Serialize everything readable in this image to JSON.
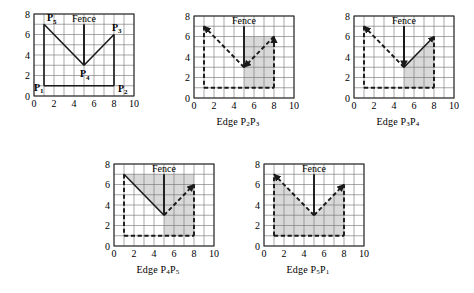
{
  "figure": {
    "title": "",
    "grid_unit": 1,
    "shade_color": "#d9d9d9",
    "line_color": "#1a1a1a",
    "grid_color": "#6e6e6e",
    "frame_color": "#2b2b2b"
  },
  "axes": {
    "x_ticks": [
      "0",
      "2",
      "4",
      "6",
      "8",
      "10"
    ],
    "x_tick_values": [
      0,
      2,
      4,
      6,
      8,
      10
    ],
    "y_ticks": [
      "0",
      "2",
      "4",
      "6",
      "8"
    ],
    "y_tick_values": [
      0,
      2,
      4,
      6,
      8
    ],
    "xlim": [
      0,
      10
    ],
    "ylim": [
      0,
      8
    ]
  },
  "polygon": {
    "vertices": [
      {
        "name": "P1",
        "label": "P",
        "sub": "1",
        "x": 1,
        "y": 1
      },
      {
        "name": "P2",
        "label": "P",
        "sub": "2",
        "x": 8,
        "y": 1
      },
      {
        "name": "P3",
        "label": "P",
        "sub": "3",
        "x": 8,
        "y": 6
      },
      {
        "name": "P4",
        "label": "P",
        "sub": "4",
        "x": 5,
        "y": 3
      },
      {
        "name": "P5",
        "label": "P",
        "sub": "5",
        "x": 1,
        "y": 7
      }
    ],
    "fence": {
      "label": "Fence",
      "x": 5,
      "y_bottom": 3,
      "y_top": 7
    }
  },
  "panels": [
    {
      "id": "panel-polygon",
      "caption": "",
      "caption_parts": [],
      "show_point_labels": true,
      "show_fence_label": true,
      "shaded": [],
      "edges": [
        {
          "from": "P1",
          "to": "P2",
          "style": "solid",
          "arrow": false
        },
        {
          "from": "P2",
          "to": "P3",
          "style": "solid",
          "arrow": false
        },
        {
          "from": "P3",
          "to": "P4",
          "style": "solid",
          "arrow": false
        },
        {
          "from": "P4",
          "to": "P5",
          "style": "solid",
          "arrow": false
        },
        {
          "from": "P5",
          "to": "P1",
          "style": "solid",
          "arrow": false
        }
      ],
      "fence_style": "solid",
      "fence_arrow": "none"
    },
    {
      "id": "panel-edge-p2p3",
      "caption": "Edge P2P3",
      "caption_parts": [
        {
          "t": "Edge ",
          "sub": false
        },
        {
          "t": "P",
          "sub": false
        },
        {
          "t": "2",
          "sub": true
        },
        {
          "t": "P",
          "sub": false
        },
        {
          "t": "3",
          "sub": true
        }
      ],
      "show_point_labels": false,
      "show_fence_label": true,
      "shaded": [
        [
          [
            5,
            1
          ],
          [
            8,
            1
          ],
          [
            8,
            6
          ],
          [
            5,
            6
          ]
        ]
      ],
      "edges": [
        {
          "from": "P1",
          "to": "P2",
          "style": "dashed",
          "arrow": false
        },
        {
          "from": "P2",
          "to": "P3",
          "style": "dashed",
          "arrow": true
        },
        {
          "from": "P3",
          "to": "P4",
          "style": "dashed",
          "arrow": true
        },
        {
          "from": "P4",
          "to": "P5",
          "style": "dashed",
          "arrow": true
        },
        {
          "from": "P5",
          "to": "P1",
          "style": "dashed",
          "arrow": false
        }
      ],
      "fence_style": "solid",
      "fence_arrow": "none"
    },
    {
      "id": "panel-edge-p3p4",
      "caption": "Edge P3P4",
      "caption_parts": [
        {
          "t": "Edge ",
          "sub": false
        },
        {
          "t": "P",
          "sub": false
        },
        {
          "t": "3",
          "sub": true
        },
        {
          "t": "P",
          "sub": false
        },
        {
          "t": "4",
          "sub": true
        }
      ],
      "show_point_labels": false,
      "show_fence_label": true,
      "shaded": [
        [
          [
            5,
            1
          ],
          [
            8,
            1
          ],
          [
            8,
            6
          ],
          [
            5,
            3
          ]
        ]
      ],
      "edges": [
        {
          "from": "P1",
          "to": "P2",
          "style": "dashed",
          "arrow": false
        },
        {
          "from": "P2",
          "to": "P3",
          "style": "dashed",
          "arrow": false
        },
        {
          "from": "P4",
          "to": "P3",
          "style": "solid",
          "arrow": true
        },
        {
          "from": "P4",
          "to": "P5",
          "style": "dashed",
          "arrow": true
        },
        {
          "from": "P5",
          "to": "P1",
          "style": "dashed",
          "arrow": false
        }
      ],
      "fence_style": "solid",
      "fence_arrow": "down"
    },
    {
      "id": "panel-edge-p4p5",
      "caption": "Edge P4P5",
      "caption_parts": [
        {
          "t": "Edge ",
          "sub": false
        },
        {
          "t": "P",
          "sub": false
        },
        {
          "t": "4",
          "sub": true
        },
        {
          "t": "P",
          "sub": false
        },
        {
          "t": "5",
          "sub": true
        }
      ],
      "show_point_labels": false,
      "show_fence_label": true,
      "shaded": [
        [
          [
            1,
            7
          ],
          [
            8,
            7
          ],
          [
            8,
            1
          ],
          [
            5,
            1
          ],
          [
            5,
            3
          ]
        ]
      ],
      "edges": [
        {
          "from": "P1",
          "to": "P2",
          "style": "dashed",
          "arrow": false
        },
        {
          "from": "P2",
          "to": "P3",
          "style": "dashed",
          "arrow": false
        },
        {
          "from": "P4",
          "to": "P3",
          "style": "dashed",
          "arrow": true
        },
        {
          "from": "P5",
          "to": "P4",
          "style": "solid",
          "arrow": false
        },
        {
          "from": "P5",
          "to": "P1",
          "style": "dashed",
          "arrow": false
        }
      ],
      "fence_style": "solid",
      "fence_arrow": "none"
    },
    {
      "id": "panel-edge-p5p1",
      "caption": "Edge P5P1",
      "caption_parts": [
        {
          "t": "Edge ",
          "sub": false
        },
        {
          "t": "P",
          "sub": false
        },
        {
          "t": "5",
          "sub": true
        },
        {
          "t": "P",
          "sub": false
        },
        {
          "t": "1",
          "sub": true
        }
      ],
      "show_point_labels": false,
      "show_fence_label": true,
      "shaded": [
        [
          [
            1,
            1
          ],
          [
            8,
            1
          ],
          [
            8,
            6
          ],
          [
            5,
            3
          ],
          [
            1,
            7
          ]
        ]
      ],
      "edges": [
        {
          "from": "P1",
          "to": "P2",
          "style": "dashed",
          "arrow": false
        },
        {
          "from": "P2",
          "to": "P3",
          "style": "dashed",
          "arrow": false
        },
        {
          "from": "P4",
          "to": "P3",
          "style": "dashed",
          "arrow": true
        },
        {
          "from": "P4",
          "to": "P5",
          "style": "dashed",
          "arrow": true
        },
        {
          "from": "P1",
          "to": "P5",
          "style": "dashed",
          "arrow": false
        }
      ],
      "fence_style": "solid",
      "fence_arrow": "none"
    }
  ],
  "panel_layout": [
    {
      "id": "panel-polygon",
      "left": 18,
      "top": 8,
      "w": 120,
      "h": 104,
      "cap_top": 112
    },
    {
      "id": "panel-edge-p2p3",
      "left": 178,
      "top": 10,
      "w": 120,
      "h": 104,
      "cap_top": 116
    },
    {
      "id": "panel-edge-p3p4",
      "left": 338,
      "top": 10,
      "w": 120,
      "h": 104,
      "cap_top": 116
    },
    {
      "id": "panel-edge-p4p5",
      "left": 98,
      "top": 158,
      "w": 120,
      "h": 104,
      "cap_top": 264
    },
    {
      "id": "panel-edge-p5p1",
      "left": 248,
      "top": 158,
      "w": 120,
      "h": 104,
      "cap_top": 264
    }
  ]
}
